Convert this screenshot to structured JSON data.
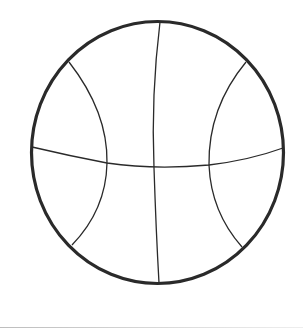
{
  "image": {
    "subject": "basketball-outline-drawing",
    "colors": {
      "background": "#ffffff",
      "outline": "#2a2a2a",
      "seams": "#2a2a2a",
      "bottom_bar": "#c8c8c8"
    }
  }
}
